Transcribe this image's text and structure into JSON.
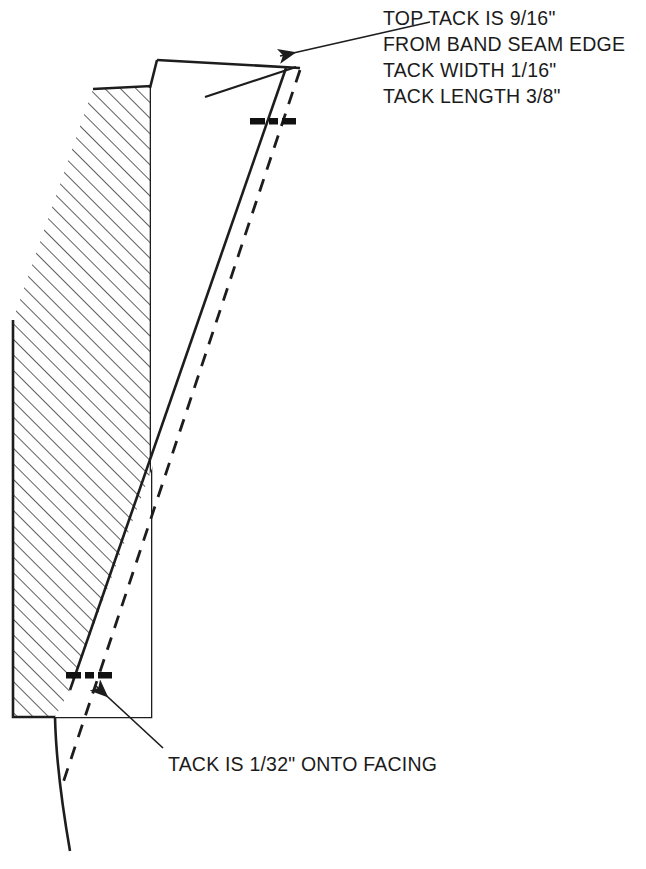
{
  "document": {
    "type": "technical-sewing-diagram",
    "title": "Collar band tack placement detail",
    "background_color": "#ffffff",
    "ink_color": "#1d1d1d"
  },
  "annotations": {
    "top_note": {
      "name": "top-tack-note",
      "lines": [
        "TOP TACK IS 9/16\"",
        "FROM BAND SEAM EDGE",
        "TACK WIDTH 1/16\"",
        "TACK LENGTH 3/8\""
      ],
      "anchor_x": 383,
      "first_line_y": 25,
      "line_height": 26
    },
    "bottom_note": {
      "name": "bottom-tack-note",
      "text": "TACK IS 1/32\" ONTO FACING",
      "anchor_x": 168,
      "baseline_y": 771
    }
  },
  "leaders": [
    {
      "name": "top-leader-arrow",
      "from_x": 430,
      "from_y": 22,
      "to_x": 280,
      "to_y": 56,
      "has_arrowhead": true
    },
    {
      "name": "bottom-leader-arrow",
      "from_x": 163,
      "from_y": 748,
      "to_x": 96,
      "to_y": 686,
      "has_arrowhead": true
    }
  ],
  "shapes": {
    "hatched_band": {
      "name": "hatched-band",
      "label": "band cross-section",
      "fill": "#ffffff",
      "hatch_angle_deg": 45,
      "hatch_spacing": 11,
      "outline_points": "93,89 151,86 151,717 13,717 13,320"
    },
    "facing_panel": {
      "name": "facing-panel",
      "label": "white facing panel",
      "fill": "#ffffff"
    }
  },
  "tack_marks": [
    {
      "name": "top-tack-mark",
      "center_x": 270,
      "center_y": 122,
      "bar_width": 16,
      "gap": 5
    },
    {
      "name": "bottom-tack-mark",
      "center_x": 87,
      "center_y": 676,
      "bar_width": 16,
      "gap": 5
    }
  ],
  "lines": {
    "panel_top_edge": {
      "name": "panel-top-edge",
      "from": [
        157,
        60
      ],
      "to": [
        300,
        68
      ]
    },
    "panel_apex": {
      "name": "panel-apex-point",
      "x": 297,
      "y": 66
    },
    "fold_line": {
      "name": "fold-crease-line",
      "from": [
        296,
        67
      ],
      "to": [
        205,
        97
      ]
    },
    "stitch_dashed_line": {
      "name": "stitch-dashed-line",
      "from": [
        300,
        70
      ],
      "to": [
        62,
        786
      ]
    },
    "facing_edge_line": {
      "name": "facing-edge-line",
      "from": [
        286,
        68
      ],
      "to": [
        70,
        690
      ]
    },
    "band_tail_curve": {
      "name": "band-tail-curve",
      "from": [
        55,
        717
      ],
      "to": [
        70,
        851
      ]
    }
  }
}
